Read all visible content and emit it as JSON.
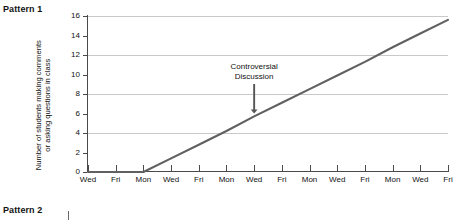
{
  "panels": {
    "pattern1_title": "Pattern 1",
    "pattern2_title": "Pattern 2"
  },
  "annotation": {
    "line1": "Controversial",
    "line2": "Discussion"
  },
  "y_axis_title": {
    "line1": "Number of students making comments",
    "line2": "or asking questions in class"
  },
  "colors": {
    "line": "#606060",
    "grid": "#c9c9c9",
    "axis": "#4a4a4a",
    "text": "#111111",
    "background": "#ffffff"
  },
  "chart_data": {
    "type": "line",
    "title": "Pattern 1",
    "xlabel": "",
    "ylabel": "Number of students making comments or asking questions in class",
    "ylim": [
      0,
      16
    ],
    "ytick_step": 2,
    "yticks": [
      0,
      2,
      4,
      6,
      8,
      10,
      12,
      14,
      16
    ],
    "gridlines_y": [
      4,
      8,
      12,
      16
    ],
    "grid": true,
    "legend": "none",
    "categories": [
      "Wed",
      "Fri",
      "Mon",
      "Wed",
      "Fri",
      "Mon",
      "Wed",
      "Fri",
      "Mon",
      "Wed",
      "Fri",
      "Mon",
      "Wed",
      "Fri"
    ],
    "x": [
      0,
      1,
      2,
      3,
      4,
      5,
      6,
      7,
      8,
      9,
      10,
      11,
      12,
      13
    ],
    "values": [
      0,
      0,
      0,
      1.4,
      2.8,
      4.2,
      5.7,
      7.1,
      8.5,
      9.9,
      11.3,
      12.8,
      14.2,
      15.6
    ],
    "annotations": [
      {
        "text": "Controversial Discussion",
        "x_category_index": 6,
        "points_to_value": 5.7,
        "arrow": "down"
      }
    ]
  }
}
